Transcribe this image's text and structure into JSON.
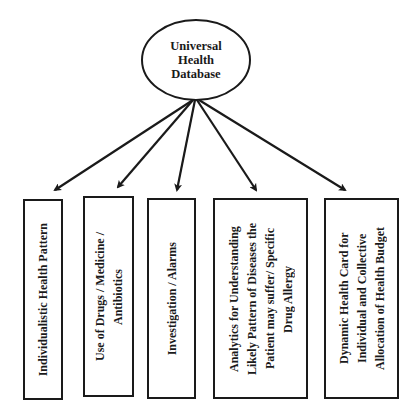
{
  "diagram": {
    "root": {
      "label": "Universal\nHealth\nDatabase",
      "lines": [
        "Universal",
        "Health",
        "Database"
      ]
    },
    "children": [
      {
        "label": "Individualistic Health Pattern"
      },
      {
        "label": "Use of Drugs / Medicine /\nAntibiotics"
      },
      {
        "label": "Investigation / Alarms"
      },
      {
        "label": "Analytics for Understanding\nLikely Pattern of Diseases the\nPatient may suffer/ Specific\nDrug Allergy"
      },
      {
        "label": "Dynamic Health Card for\nIndividual and Collective\nAllocation of Health Budget"
      }
    ],
    "colors": {
      "stroke": "#1a1a1a",
      "background": "#ffffff"
    }
  }
}
